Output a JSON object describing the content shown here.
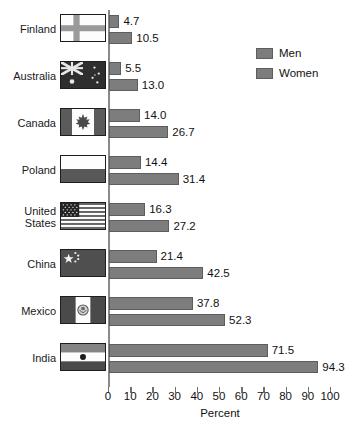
{
  "chart_data": {
    "type": "bar",
    "title": "",
    "orientation": "horizontal",
    "grouped": true,
    "categories": [
      "Finland",
      "Australia",
      "Canada",
      "Poland",
      "United States",
      "China",
      "Mexico",
      "India"
    ],
    "series": [
      {
        "name": "Men",
        "values": [
          4.7,
          5.5,
          14.0,
          14.4,
          16.3,
          21.4,
          37.8,
          71.5
        ]
      },
      {
        "name": "Women",
        "values": [
          10.5,
          13.0,
          26.7,
          31.4,
          27.2,
          42.5,
          52.3,
          94.3
        ]
      }
    ],
    "xlabel": "Percent",
    "ylabel": "",
    "xlim": [
      0,
      100
    ],
    "xticks": [
      0,
      10,
      20,
      30,
      40,
      50,
      60,
      70,
      80,
      90,
      100
    ],
    "xtick_labels": [
      "0",
      "10",
      "20",
      "30",
      "40",
      "50",
      "60",
      "70",
      "80",
      "90",
      "100"
    ],
    "grid": false,
    "legend_position": "top-right",
    "data_labels": true,
    "bar_color": "#7d7d7d",
    "bar_border_color": "#5d5d5d",
    "axis_color": "#8a8a8a",
    "background": "#ffffff"
  },
  "rows": [
    {
      "country": "Finland",
      "country_line1": "Finland",
      "country_line2": "",
      "flag": "flag-finland",
      "men": "4.7",
      "women": "10.5",
      "men_value": 4.7,
      "women_value": 10.5
    },
    {
      "country": "Australia",
      "country_line1": "Australia",
      "country_line2": "",
      "flag": "flag-australia",
      "men": "5.5",
      "women": "13.0",
      "men_value": 5.5,
      "women_value": 13.0
    },
    {
      "country": "Canada",
      "country_line1": "Canada",
      "country_line2": "",
      "flag": "flag-canada",
      "men": "14.0",
      "women": "26.7",
      "men_value": 14.0,
      "women_value": 26.7
    },
    {
      "country": "Poland",
      "country_line1": "Poland",
      "country_line2": "",
      "flag": "flag-poland",
      "men": "14.4",
      "women": "31.4",
      "men_value": 14.4,
      "women_value": 31.4
    },
    {
      "country": "United States",
      "country_line1": "United",
      "country_line2": "States",
      "flag": "flag-united-states",
      "men": "16.3",
      "women": "27.2",
      "men_value": 16.3,
      "women_value": 27.2
    },
    {
      "country": "China",
      "country_line1": "China",
      "country_line2": "",
      "flag": "flag-china",
      "men": "21.4",
      "women": "42.5",
      "men_value": 21.4,
      "women_value": 42.5
    },
    {
      "country": "Mexico",
      "country_line1": "Mexico",
      "country_line2": "",
      "flag": "flag-mexico",
      "men": "37.8",
      "women": "52.3",
      "men_value": 37.8,
      "women_value": 52.3
    },
    {
      "country": "India",
      "country_line1": "India",
      "country_line2": "",
      "flag": "flag-india",
      "men": "71.5",
      "women": "94.3",
      "men_value": 71.5,
      "women_value": 94.3
    }
  ],
  "legend": {
    "items": [
      {
        "label": "Men"
      },
      {
        "label": "Women"
      }
    ]
  },
  "axis": {
    "title": "Percent",
    "ticks": [
      "0",
      "10",
      "20",
      "30",
      "40",
      "50",
      "60",
      "70",
      "80",
      "90",
      "100"
    ]
  }
}
